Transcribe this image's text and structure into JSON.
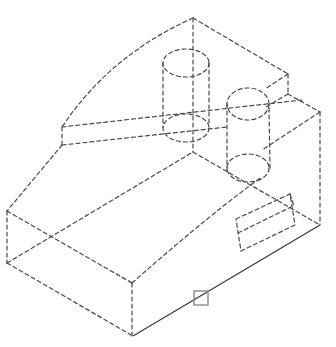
{
  "drawing": {
    "type": "isometric-wireframe",
    "description": "Isometric view of a machined block with sloped top, two cylindrical bosses and a rectangular pocket; hidden edges shown dashed, one selected visible edge shown solid",
    "colors": {
      "background": "#ffffff",
      "hidden_line": "#4a4a4a",
      "solid_edge": "#3a3a3a",
      "selection_marker": "#8a8a8a"
    },
    "selected_edge": {
      "from": [
        133,
        336
      ],
      "to": [
        320,
        225
      ]
    },
    "selection_marker": {
      "x": 194,
      "y": 291,
      "size": 14
    }
  }
}
